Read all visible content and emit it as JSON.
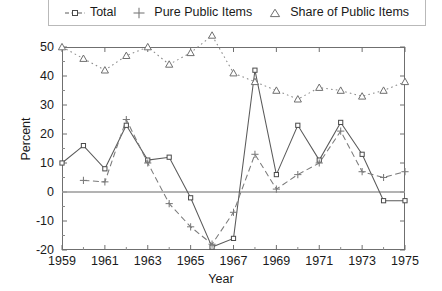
{
  "chart_data": {
    "type": "line",
    "title": "",
    "xlabel": "Year",
    "ylabel": "Percent",
    "xlim": [
      1959,
      1975
    ],
    "ylim": [
      -20,
      50
    ],
    "xticks": [
      1959,
      1961,
      1963,
      1965,
      1967,
      1969,
      1971,
      1973,
      1975
    ],
    "xtick_labels": [
      "1959",
      "1961",
      "1963",
      "1965",
      "1967",
      "1969",
      "1971",
      "1973",
      "1975"
    ],
    "yticks": [
      50,
      40,
      30,
      20,
      10,
      0,
      -10,
      -20
    ],
    "ytick_labels": [
      "50",
      "40",
      "30",
      "20",
      "10",
      "0",
      "-10",
      "-20"
    ],
    "minor_xticks": [
      1960,
      1962,
      1964,
      1966,
      1968,
      1970,
      1972,
      1974
    ],
    "minor_yticks": [
      45,
      35,
      25,
      15,
      5,
      -5,
      -15
    ],
    "grid": false,
    "legend_position": "top",
    "zero_line": true,
    "x": [
      1959,
      1960,
      1961,
      1962,
      1963,
      1964,
      1965,
      1966,
      1967,
      1968,
      1969,
      1970,
      1971,
      1972,
      1973,
      1974,
      1975
    ],
    "series": [
      {
        "name": "Total",
        "marker": "square",
        "linestyle": "solid",
        "color": "#5a5a5a",
        "values": [
          10,
          16,
          8,
          23,
          11,
          12,
          -2,
          -19,
          -16,
          42,
          6,
          23,
          11,
          24,
          13,
          -3,
          -3
        ]
      },
      {
        "name": "Pure Public Items",
        "marker": "plus",
        "linestyle": "dashed",
        "color": "#7a7a7a",
        "values": [
          null,
          4,
          3.5,
          25,
          10,
          -4,
          -12,
          -18,
          -7,
          13,
          1,
          6,
          10,
          21,
          7,
          5,
          7
        ]
      },
      {
        "name": "Share of Public Items",
        "marker": "triangle",
        "linestyle": "dotted",
        "color": "#8a8a8a",
        "values": [
          50,
          46,
          42,
          47,
          50,
          44,
          48,
          54,
          41,
          38,
          35,
          32,
          36,
          35,
          33,
          35,
          38
        ]
      }
    ]
  },
  "legend": {
    "items": [
      {
        "label": "Total",
        "marker": "square-dashed-marker"
      },
      {
        "label": "Pure Public Items",
        "marker": "plus-marker"
      },
      {
        "label": "Share of Public Items",
        "marker": "triangle-marker"
      }
    ]
  }
}
